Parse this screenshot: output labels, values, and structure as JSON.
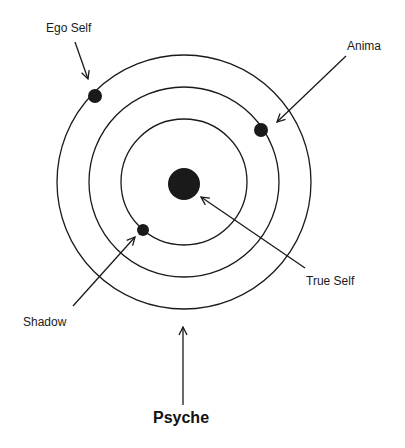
{
  "diagram": {
    "title": "Psyche",
    "labels": {
      "ego_self": "Ego Self",
      "anima": "Anima",
      "true_self": "True Self",
      "shadow": "Shadow",
      "psyche": "Psyche"
    },
    "center": {
      "x": 184,
      "y": 182
    },
    "circles": [
      {
        "name": "outer-ring",
        "r": 127
      },
      {
        "name": "middle-ring",
        "r": 95
      },
      {
        "name": "inner-ring",
        "r": 63
      }
    ],
    "nodes": [
      {
        "name": "true-self-node",
        "label": "True Self",
        "cx": 184,
        "cy": 184,
        "r": 16
      },
      {
        "name": "ego-self-node",
        "label": "Ego Self",
        "cx": 95,
        "cy": 96,
        "r": 7
      },
      {
        "name": "anima-node",
        "label": "Anima",
        "cx": 261,
        "cy": 130,
        "r": 7
      },
      {
        "name": "shadow-node",
        "label": "Shadow",
        "cx": 143,
        "cy": 230,
        "r": 6
      }
    ],
    "colors": {
      "stroke": "#1a1a1a",
      "fill": "#1a1a1a",
      "background": "#ffffff"
    }
  }
}
